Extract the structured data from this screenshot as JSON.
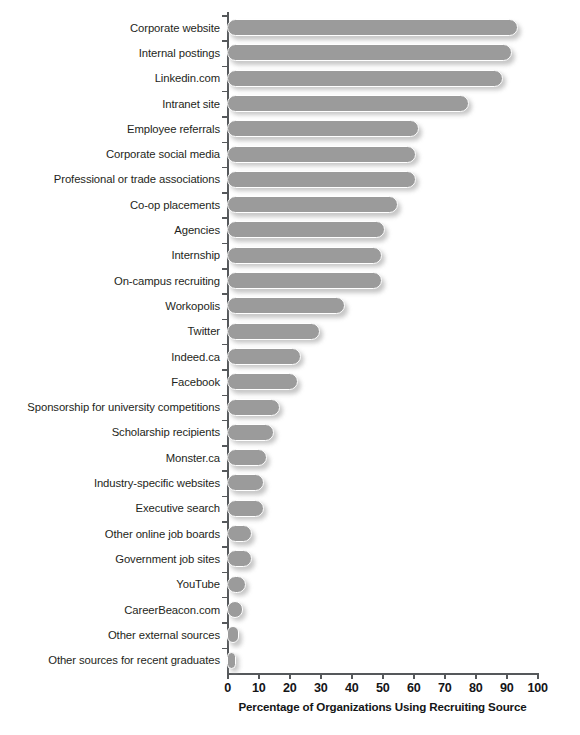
{
  "chart_data": {
    "type": "bar",
    "orientation": "horizontal",
    "title": "",
    "xlabel": "Percentage of Organizations Using Recruiting Source",
    "ylabel": "",
    "xlim": [
      0,
      100
    ],
    "xticks": [
      0,
      10,
      20,
      30,
      40,
      50,
      60,
      70,
      80,
      90,
      100
    ],
    "grid": false,
    "legend": null,
    "bar_color": "#9b9b9b",
    "categories": [
      "Corporate website",
      "Internal postings",
      "Linkedin.com",
      "Intranet site",
      "Employee referrals",
      "Corporate social media",
      "Professional or trade associations",
      "Co-op placements",
      "Agencies",
      "Internship",
      "On-campus recruiting",
      "Workopolis",
      "Twitter",
      "Indeed.ca",
      "Facebook",
      "Sponsorship for university competitions",
      "Scholarship recipients",
      "Monster.ca",
      "Industry-specific websites",
      "Executive search",
      "Other online job boards",
      "Government job sites",
      "YouTube",
      "CareerBeacon.com",
      "Other external sources",
      "Other sources for recent graduates"
    ],
    "values": [
      94,
      92,
      89,
      78,
      62,
      61,
      61,
      55,
      51,
      50,
      50,
      38,
      30,
      24,
      23,
      17,
      15,
      13,
      12,
      12,
      8,
      8,
      6,
      5,
      4,
      3
    ]
  }
}
